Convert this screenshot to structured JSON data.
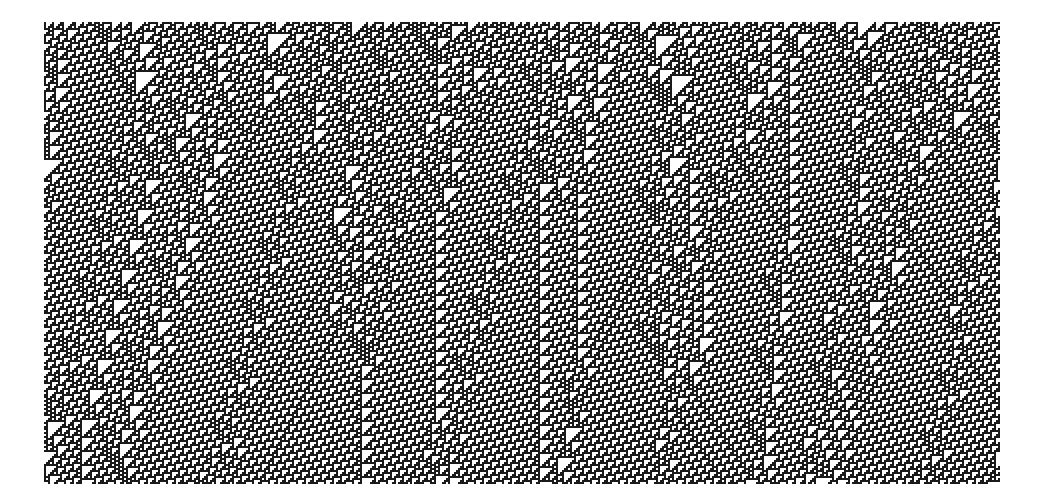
{
  "figure": {
    "kind": "elementary cellular automaton",
    "rule": 110,
    "initial_condition": "random",
    "cells_per_row": 478,
    "generations": 231,
    "colors": {
      "alive": "#1a1a1a",
      "dead": "#ffffff"
    },
    "seed": 12345,
    "density": 0.5
  }
}
